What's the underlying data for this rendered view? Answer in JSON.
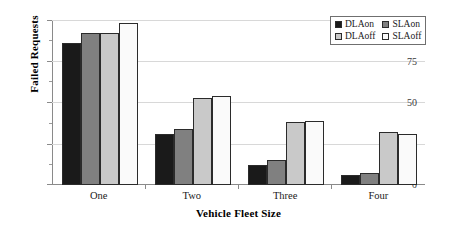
{
  "chart_data": {
    "type": "bar",
    "title": "",
    "xlabel": "Vehicle Fleet Size",
    "ylabel": "Failed Requests",
    "categories": [
      "One",
      "Two",
      "Three",
      "Four"
    ],
    "ylim": [
      0,
      100
    ],
    "yticks": [
      0,
      25,
      50,
      75,
      100
    ],
    "ytick_labels": [
      "0",
      "25",
      "50",
      "75",
      "100"
    ],
    "yminor_ticks": [
      12.5,
      37.5,
      62.5,
      87.5
    ],
    "grid": "horizontal",
    "legend_position": "top-right",
    "series": [
      {
        "name": "DLAon",
        "color": "#1a1a1a",
        "values": [
          86,
          31,
          12,
          6
        ]
      },
      {
        "name": "SLAon",
        "color": "#808080",
        "values": [
          92,
          34,
          15,
          7
        ]
      },
      {
        "name": "DLAoff",
        "color": "#c9c9c9",
        "values": [
          92,
          53,
          38,
          32
        ]
      },
      {
        "name": "SLAoff",
        "color": "#fafafa",
        "values": [
          98,
          54,
          39,
          31
        ]
      }
    ]
  }
}
